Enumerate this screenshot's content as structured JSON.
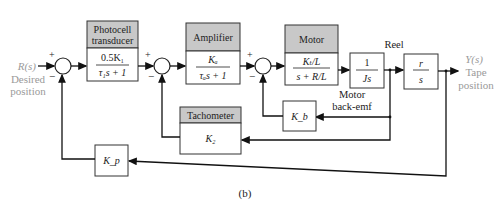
{
  "input": {
    "signal": "R(s)",
    "label_line1": "Desired",
    "label_line2": "position"
  },
  "output": {
    "signal": "Y(s)",
    "label_line1": "Tape",
    "label_line2": "position"
  },
  "summers": [
    {
      "id": "s1",
      "plus": "+",
      "minus": "−"
    },
    {
      "id": "s2",
      "plus": "+",
      "minus": "−"
    },
    {
      "id": "s3",
      "plus": "+",
      "minus": "−"
    }
  ],
  "blocks": {
    "photocell": {
      "title_line1": "Photocell",
      "title_line2": "transducer",
      "num": "0.5K₁",
      "den": "τ₁s + 1"
    },
    "amplifier": {
      "title": "Amplifier",
      "num": "Kₐ",
      "den": "τₐs + 1"
    },
    "motor": {
      "title": "Motor",
      "num": "Kₜ/L",
      "den": "s + R/L"
    },
    "inertia": {
      "num": "1",
      "den": "Js"
    },
    "reel": {
      "title": "Reel",
      "num": "r",
      "den": "s"
    },
    "tachometer": {
      "title": "Tachometer",
      "gain": "K₂"
    },
    "backemf": {
      "gain": "K_b",
      "label_line1": "Motor",
      "label_line2": "back-emf"
    },
    "position_sensor": {
      "gain": "K_p"
    }
  },
  "caption": "(b)"
}
